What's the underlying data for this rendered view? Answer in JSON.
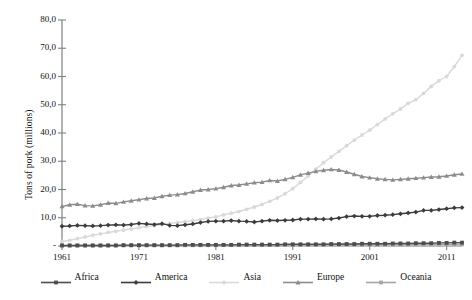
{
  "chart_data": {
    "type": "line",
    "title": "",
    "xlabel": "",
    "ylabel": "Tons of pork (millions)",
    "xlim": [
      1961,
      2013
    ],
    "ylim": [
      0,
      80
    ],
    "grid": false,
    "legend_position": "bottom",
    "y_ticks": [
      "-",
      "10,0",
      "20,0",
      "30,0",
      "40,0",
      "50,0",
      "60,0",
      "70,0",
      "80,0"
    ],
    "y_tick_values": [
      0,
      10,
      20,
      30,
      40,
      50,
      60,
      70,
      80
    ],
    "x_ticks": [
      "1961",
      "1971",
      "1981",
      "1991",
      "2001",
      "2011"
    ],
    "x_tick_values": [
      1961,
      1971,
      1981,
      1991,
      2001,
      2011
    ],
    "x": [
      1961,
      1962,
      1963,
      1964,
      1965,
      1966,
      1967,
      1968,
      1969,
      1970,
      1971,
      1972,
      1973,
      1974,
      1975,
      1976,
      1977,
      1978,
      1979,
      1980,
      1981,
      1982,
      1983,
      1984,
      1985,
      1986,
      1987,
      1988,
      1989,
      1990,
      1991,
      1992,
      1993,
      1994,
      1995,
      1996,
      1997,
      1998,
      1999,
      2000,
      2001,
      2002,
      2003,
      2004,
      2005,
      2006,
      2007,
      2008,
      2009,
      2010,
      2011,
      2012,
      2013
    ],
    "series": [
      {
        "name": "Africa",
        "color": "#4d4d4d",
        "marker": "square",
        "values": [
          0.2,
          0.2,
          0.2,
          0.2,
          0.2,
          0.2,
          0.2,
          0.2,
          0.3,
          0.3,
          0.3,
          0.3,
          0.3,
          0.3,
          0.3,
          0.3,
          0.4,
          0.4,
          0.4,
          0.4,
          0.4,
          0.4,
          0.4,
          0.5,
          0.5,
          0.5,
          0.5,
          0.5,
          0.5,
          0.6,
          0.6,
          0.6,
          0.6,
          0.6,
          0.6,
          0.7,
          0.7,
          0.7,
          0.7,
          0.8,
          0.8,
          0.8,
          0.8,
          0.9,
          0.9,
          0.9,
          1.0,
          1.0,
          1.0,
          1.1,
          1.1,
          1.2,
          1.2
        ]
      },
      {
        "name": "America",
        "color": "#3c3c3c",
        "marker": "diamond",
        "values": [
          7.0,
          7.1,
          7.3,
          7.2,
          7.1,
          7.2,
          7.4,
          7.5,
          7.4,
          7.6,
          8.0,
          7.8,
          7.6,
          7.9,
          7.3,
          7.2,
          7.5,
          7.8,
          8.3,
          8.7,
          8.8,
          8.8,
          9.0,
          8.8,
          8.7,
          8.5,
          8.8,
          9.1,
          9.0,
          9.1,
          9.2,
          9.5,
          9.5,
          9.6,
          9.5,
          9.6,
          9.9,
          10.4,
          10.6,
          10.5,
          10.5,
          10.8,
          10.9,
          11.1,
          11.4,
          11.7,
          12.0,
          12.6,
          12.6,
          12.9,
          13.2,
          13.5,
          13.6
        ]
      },
      {
        "name": "Asia",
        "color": "#d9d9d9",
        "marker": "circle",
        "values": [
          1.6,
          2.0,
          2.6,
          3.2,
          3.8,
          4.3,
          4.8,
          5.2,
          5.6,
          6.0,
          6.5,
          6.9,
          7.2,
          7.6,
          8.0,
          8.3,
          8.6,
          9.0,
          9.4,
          9.9,
          10.3,
          11.0,
          11.6,
          12.2,
          13.0,
          13.8,
          14.7,
          15.8,
          17.0,
          18.5,
          20.3,
          22.5,
          24.8,
          27.2,
          29.5,
          31.5,
          33.5,
          35.5,
          37.5,
          39.3,
          41.0,
          43.0,
          45.0,
          46.8,
          48.5,
          50.5,
          51.8,
          54.0,
          56.5,
          58.5,
          60.0,
          63.5,
          67.5
        ]
      },
      {
        "name": "Europe",
        "color": "#8c8c8c",
        "marker": "triangle",
        "values": [
          14.0,
          14.6,
          14.8,
          14.3,
          14.2,
          14.6,
          15.2,
          15.1,
          15.6,
          16.0,
          16.4,
          16.8,
          17.0,
          17.6,
          18.0,
          18.2,
          18.6,
          19.2,
          19.8,
          20.0,
          20.3,
          20.8,
          21.4,
          21.6,
          22.0,
          22.4,
          22.6,
          23.2,
          23.0,
          23.6,
          24.3,
          25.2,
          25.8,
          26.4,
          26.8,
          27.1,
          26.9,
          26.2,
          25.4,
          24.6,
          24.2,
          23.8,
          23.6,
          23.4,
          23.6,
          23.8,
          24.0,
          24.2,
          24.4,
          24.5,
          24.8,
          25.2,
          25.5
        ]
      },
      {
        "name": "Oceania",
        "color": "#a6a6a6",
        "marker": "square",
        "values": [
          0.15,
          0.15,
          0.16,
          0.16,
          0.17,
          0.17,
          0.18,
          0.18,
          0.19,
          0.2,
          0.2,
          0.21,
          0.22,
          0.22,
          0.23,
          0.24,
          0.25,
          0.26,
          0.27,
          0.28,
          0.29,
          0.3,
          0.31,
          0.32,
          0.33,
          0.34,
          0.35,
          0.36,
          0.37,
          0.38,
          0.39,
          0.4,
          0.41,
          0.42,
          0.43,
          0.44,
          0.45,
          0.46,
          0.47,
          0.48,
          0.49,
          0.5,
          0.51,
          0.52,
          0.53,
          0.54,
          0.55,
          0.56,
          0.57,
          0.58,
          0.59,
          0.6,
          0.61
        ]
      }
    ]
  },
  "axis": {
    "color": "#808080"
  }
}
